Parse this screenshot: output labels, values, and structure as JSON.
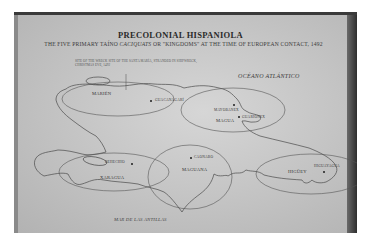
{
  "map": {
    "title": "PRECOLONIAL HISPANIOLA",
    "subtitle_pre": "THE FIVE PRIMARY TAÍNO ",
    "subtitle_italic": "CACIQUATS",
    "subtitle_post": " OR \"KINGDOMS\" AT THE TIME OF EUROPEAN CONTACT, 1492",
    "annotation": "SITE OF THE WRECK SITE OF THE SANTA MARÍA, STRANDED IN SHIPWRECK, CHRISTMAS EVE, 1492",
    "ocean_label": "OCÉANO ATLÁNTICO",
    "sea_label": "MAR DE LAS ANTILLAS",
    "kingdoms": [
      {
        "name": "MARIÉN"
      },
      {
        "name": "MAGUA"
      },
      {
        "name": "XARAGUA"
      },
      {
        "name": "MAGUANA"
      },
      {
        "name": "HIGÜEY"
      }
    ],
    "caciques": [
      {
        "name": "GUACANAGARÍ"
      },
      {
        "name": "MAYOBANEX"
      },
      {
        "name": "GUARIONEX"
      },
      {
        "name": "BEHECHIO"
      },
      {
        "name": "CAONABO"
      },
      {
        "name": "HIGUAYAGUA"
      }
    ],
    "colors": {
      "board": "#c6c6c6",
      "ink": "#2a2a2a",
      "top_strip": "#3a3a3a",
      "right_edge": "#2e2e2e"
    }
  }
}
